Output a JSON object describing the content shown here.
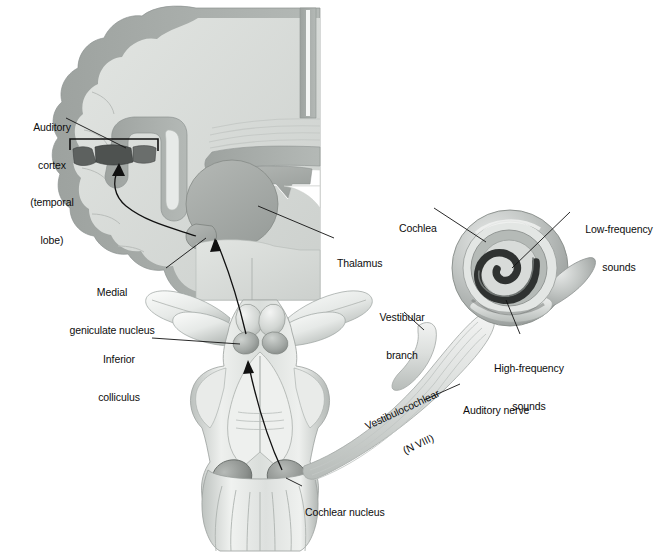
{
  "figure": {
    "background_color": "#ffffff",
    "width": 668,
    "height": 553
  },
  "palette": {
    "line": "#111111",
    "cortex_ribbon": "#a9aeab",
    "white_matter": "#d7dad6",
    "thalamus": "#a8aca9",
    "dark_nucleus": "#4a4d4c",
    "brainstem_light": "#eceeec",
    "brainstem_mid": "#c3c7c5",
    "brainstem_shadow": "#9aa09d",
    "cochlea_outer": "#b9bdbb",
    "cochlea_dark": "#3b3d3c",
    "nerve": "#dfe2e0",
    "text": "#0d0d0d"
  },
  "labels": [
    {
      "id": "auditory-cortex",
      "lines": [
        "Auditory",
        "cortex",
        "(temporal",
        "lobe)"
      ],
      "x": 14,
      "y": 96,
      "align": "center",
      "width": 76
    },
    {
      "id": "medial-geniculate-nucleus",
      "lines": [
        "Medial",
        "geniculate nucleus"
      ],
      "x": 56,
      "y": 261,
      "align": "center",
      "width": 108
    },
    {
      "id": "inferior-colliculus",
      "lines": [
        "Inferior",
        "colliculus"
      ],
      "x": 88,
      "y": 328,
      "align": "center",
      "width": 62
    },
    {
      "id": "thalamus",
      "lines": [
        "Thalamus"
      ],
      "x": 337,
      "y": 232,
      "align": "left",
      "width": 60
    },
    {
      "id": "cochlea",
      "lines": [
        "Cochlea"
      ],
      "x": 399,
      "y": 197,
      "align": "left",
      "width": 50
    },
    {
      "id": "low-frequency-sounds",
      "lines": [
        "Low-frequency",
        "sounds"
      ],
      "x": 575,
      "y": 198,
      "align": "center",
      "width": 88
    },
    {
      "id": "high-frequency-sounds",
      "lines": [
        "High-frequency",
        "sounds"
      ],
      "x": 483,
      "y": 337,
      "align": "center",
      "width": 92
    },
    {
      "id": "vestibular-branch",
      "lines": [
        "Vestibular",
        "branch"
      ],
      "x": 370,
      "y": 286,
      "align": "center",
      "width": 64
    },
    {
      "id": "auditory-nerve",
      "lines": [
        "Auditory nerve"
      ],
      "x": 463,
      "y": 379,
      "align": "left",
      "width": 86
    },
    {
      "id": "cochlear-nucleus",
      "lines": [
        "Cochlear nucleus"
      ],
      "x": 305,
      "y": 481,
      "align": "left",
      "width": 100
    }
  ],
  "rotated_labels": [
    {
      "id": "vestibulocochlear-nerve",
      "lines": [
        "Vestibulocochlear",
        "(N VIII)"
      ],
      "x": 340,
      "y": 404,
      "rotation_deg": -25
    }
  ],
  "structures": [
    {
      "id": "cerebral-hemisphere",
      "name": "Cerebral hemisphere (coronal section)"
    },
    {
      "id": "corpus-callosum",
      "name": "Corpus callosum"
    },
    {
      "id": "lateral-ventricle",
      "name": "Lateral ventricle"
    },
    {
      "id": "thalamus-body",
      "name": "Thalamus"
    },
    {
      "id": "medial-geniculate-body",
      "name": "Medial geniculate nucleus"
    },
    {
      "id": "heschl-gyrus",
      "name": "Auditory cortex (Heschl's gyrus)"
    },
    {
      "id": "brainstem",
      "name": "Brainstem (dorsal view)"
    },
    {
      "id": "superior-colliculus",
      "name": "Superior colliculus"
    },
    {
      "id": "inferior-colliculus-body",
      "name": "Inferior colliculus"
    },
    {
      "id": "cerebellar-peduncles",
      "name": "Cut cerebellar peduncles"
    },
    {
      "id": "cochlear-nucleus-body",
      "name": "Cochlear nucleus"
    },
    {
      "id": "medulla",
      "name": "Medulla oblongata"
    },
    {
      "id": "cochlea-spiral",
      "name": "Cochlea"
    },
    {
      "id": "auditory-nerve-bundle",
      "name": "Auditory nerve"
    },
    {
      "id": "vestibular-branch-body",
      "name": "Vestibular branch"
    }
  ]
}
